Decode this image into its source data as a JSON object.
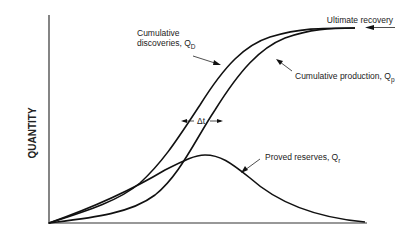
{
  "diagram": {
    "type": "concept-curves",
    "y_axis_label": "QUANTITY",
    "x_axis_label": "",
    "labels": {
      "ultimate_recovery": "Ultimate recovery",
      "discoveries_line1": "Cumulative",
      "discoveries_line2": "discoveries, Q",
      "discoveries_sub": "D",
      "production": "Cumulative production, Q",
      "production_sub": "p",
      "reserves": "Proved reserves, Q",
      "reserves_sub": "r",
      "delta_t": "Δt"
    },
    "curves": {
      "cumulative_discoveries": "M49,223 C90,210 120,200 140,183 C165,160 180,135 200,105 C225,65 245,45 270,37 C300,28 320,28 355,28",
      "cumulative_production": "M49,223 C90,218 130,214 155,195 C180,175 195,140 215,110 C240,70 260,48 285,38 C310,29 330,28 355,28",
      "proved_reserves": "M49,223 C100,205 140,185 165,170 C185,160 195,155 205,155 C220,155 230,162 250,178 C280,205 320,218 365,222"
    },
    "colors": {
      "line": "#111111",
      "background": "#ffffff"
    }
  }
}
